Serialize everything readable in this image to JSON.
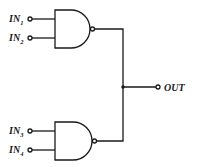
{
  "diagram": {
    "type": "logic-circuit",
    "gates": [
      {
        "id": "gate-top",
        "type": "NAND",
        "inputs": [
          "IN1",
          "IN2"
        ]
      },
      {
        "id": "gate-bottom",
        "type": "NAND",
        "inputs": [
          "IN3",
          "IN4"
        ]
      }
    ],
    "inputs": [
      {
        "base": "IN",
        "sub": "1"
      },
      {
        "base": "IN",
        "sub": "2"
      },
      {
        "base": "IN",
        "sub": "3"
      },
      {
        "base": "IN",
        "sub": "4"
      }
    ],
    "output": {
      "label": "OUT"
    },
    "colors": {
      "line": "#1a1a1a",
      "background": "#ffffff"
    }
  }
}
